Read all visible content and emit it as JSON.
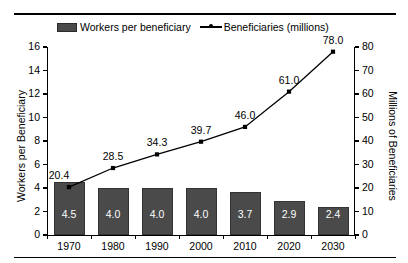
{
  "chart_data": {
    "type": "bar",
    "title": "",
    "categories": [
      "1970",
      "1980",
      "1990",
      "2000",
      "2010",
      "2020",
      "2030"
    ],
    "xlabel": "",
    "ylabel": "Workers per Beneficiary",
    "ylabel_secondary": "Millions of Beneficiaries",
    "ylim": [
      0,
      16
    ],
    "ylim_secondary": [
      0,
      80
    ],
    "yticks": [
      "0",
      "2",
      "4",
      "6",
      "8",
      "10",
      "12",
      "14",
      "16"
    ],
    "yticks_secondary": [
      "0",
      "10",
      "20",
      "30",
      "40",
      "50",
      "60",
      "70",
      "80"
    ],
    "grid": false,
    "legend_position": "top",
    "series": [
      {
        "name": "Workers per beneficiary",
        "type": "bar",
        "axis": "left",
        "color": "#4a4a4a",
        "values": [
          4.5,
          4.0,
          4.0,
          4.0,
          3.7,
          2.9,
          2.4
        ],
        "labels": [
          "4.5",
          "4.0",
          "4.0",
          "4.0",
          "3.7",
          "2.9",
          "2.4"
        ]
      },
      {
        "name": "Beneficiaries (millions)",
        "type": "line",
        "axis": "right",
        "color": "#000000",
        "values": [
          20.4,
          28.5,
          34.3,
          39.7,
          46.0,
          61.0,
          78.0
        ],
        "labels": [
          "20.4",
          "28.5",
          "34.3",
          "39.7",
          "46.0",
          "61.0",
          "78.0"
        ]
      }
    ]
  },
  "legend": {
    "bar_label": "Workers per beneficiary",
    "line_label": "Beneficiaries (millions)"
  },
  "axes": {
    "left_title": "Workers per Beneficiary",
    "right_title": "Millions of Beneficiaries"
  }
}
